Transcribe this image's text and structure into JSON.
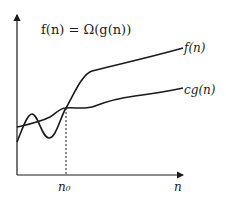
{
  "diagram": {
    "title": "f(n) = Ω(g(n))",
    "curves": [
      {
        "name": "f(n)",
        "label": "f(n)"
      },
      {
        "name": "cg(n)",
        "label": "cg(n)"
      }
    ],
    "x_axis_label": "n",
    "threshold_label": "n₀",
    "colors": {
      "line": "#1a1a1a",
      "background": "#ffffff"
    }
  }
}
